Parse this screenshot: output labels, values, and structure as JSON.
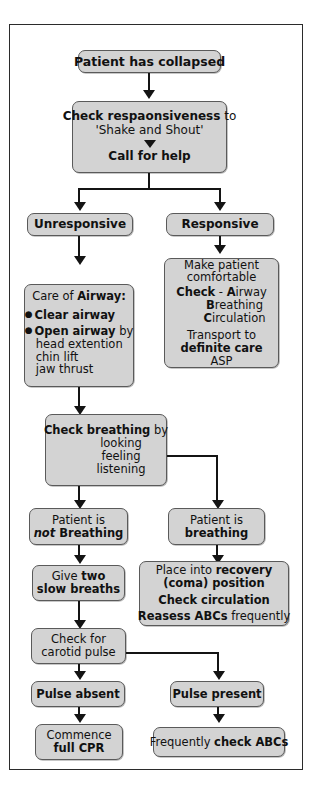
{
  "diagram": {
    "colors": {
      "box_fill": "#d3d3d3",
      "box_border": "#5a5a5a",
      "connector": "#141414",
      "frame": "#2b2b2b",
      "page_background": "#ffffff"
    },
    "nodes": {
      "collapsed": {
        "text": "Patient has collapsed"
      },
      "check_responsiveness": {
        "line1_bold": "Check respaonsiveness",
        "line1_rest": " to",
        "line2": "'Shake and Shout'",
        "arrow": "down-triangle-icon",
        "line3": "Call for help"
      },
      "unresponsive": {
        "text": "Unresponsive"
      },
      "responsive": {
        "text": "Responsive"
      },
      "care_of_airway": {
        "heading_plain": "Care of ",
        "heading_bold": "Airway:",
        "bullet1_bold": "Clear airway",
        "bullet2_bold": "Open airway",
        "bullet2_rest": " by",
        "sub1": "head extention",
        "sub2": "chin lift",
        "sub3": "jaw thrust"
      },
      "make_comfortable": {
        "line1": "Make patient",
        "line2": "comfortable",
        "check_bold": "Check",
        "check_dash": " - ",
        "abc_a_bold": "A",
        "abc_a_rest": "irway",
        "abc_b_bold": "B",
        "abc_b_rest": "reathing",
        "abc_c_bold": "C",
        "abc_c_rest": "irculation",
        "transport": "Transport to",
        "definite_care": "definite care",
        "asp": "ASP"
      },
      "check_breathing": {
        "bold": "Check breathing",
        "rest": " by",
        "sub1": "looking",
        "sub2": "feeling",
        "sub3": "listening"
      },
      "not_breathing": {
        "line1": "Patient is",
        "line2_italic": "not",
        "line2_bold": " Breathing"
      },
      "is_breathing": {
        "line1": "Patient is",
        "line2": "breathing"
      },
      "two_breaths": {
        "line1_plain": "Give ",
        "line1_bold": "two",
        "line2_bold": "slow breaths"
      },
      "recovery_position": {
        "line1_plain": "Place into ",
        "line1_bold": "recovery",
        "line2_bold": "(coma) position",
        "line3_bold": "Check circulation",
        "line4_bold": "Reasess ABCs",
        "line4_rest": " frequently"
      },
      "carotid_pulse": {
        "line1": "Check for",
        "line2": "carotid pulse"
      },
      "pulse_absent": {
        "text": "Pulse absent"
      },
      "pulse_present": {
        "text": "Pulse present"
      },
      "commence_cpr": {
        "line1": "Commence",
        "line2_bold": "full CPR"
      },
      "check_abcs": {
        "plain": "Frequently ",
        "bold": "check ABCs"
      }
    }
  }
}
